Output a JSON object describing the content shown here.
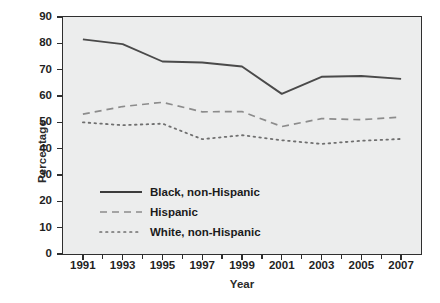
{
  "chart_data": {
    "type": "line",
    "title": "",
    "xlabel": "Year",
    "ylabel": "Percentage",
    "x": [
      1991,
      1993,
      1995,
      1997,
      1999,
      2001,
      2003,
      2005,
      2007
    ],
    "xlim": [
      1990,
      2008
    ],
    "ylim": [
      0,
      90
    ],
    "ytick_labels": [
      "0",
      "10",
      "20",
      "30",
      "40",
      "50",
      "60",
      "70",
      "80",
      "90"
    ],
    "ytick_values": [
      0,
      10,
      20,
      30,
      40,
      50,
      60,
      70,
      80,
      90
    ],
    "xtick_labels": [
      "1991",
      "1993",
      "1995",
      "1997",
      "1999",
      "2001",
      "2003",
      "2005",
      "2007"
    ],
    "xtick_values": [
      1991,
      1993,
      1995,
      1997,
      1999,
      2001,
      2003,
      2005,
      2007
    ],
    "grid": false,
    "legend_position": "lower-left-inside",
    "series": [
      {
        "name": "Black, non-Hispanic",
        "style": "solid",
        "color": "#4a4a4a",
        "values": [
          81.5,
          79.7,
          73.1,
          72.7,
          71.2,
          60.8,
          67.3,
          67.6,
          66.5
        ]
      },
      {
        "name": "Hispanic",
        "style": "dashed",
        "color": "#8c8c8c",
        "values": [
          53.1,
          56.0,
          57.6,
          54.0,
          54.1,
          48.4,
          51.4,
          51.0,
          52.0
        ]
      },
      {
        "name": "White, non-Hispanic",
        "style": "dotted",
        "color": "#6f6f6f",
        "values": [
          50.0,
          48.9,
          49.5,
          43.6,
          45.1,
          43.2,
          41.8,
          43.0,
          43.7
        ]
      }
    ]
  },
  "axes": {
    "y_title": "Percentage",
    "x_title": "Year"
  },
  "legend": {
    "items": [
      {
        "label": "Black, non-Hispanic"
      },
      {
        "label": "Hispanic"
      },
      {
        "label": "White, non-Hispanic"
      }
    ]
  },
  "colors": {
    "plot_background": "#eceded",
    "frame": "#2f2f2f",
    "text": "#1f1f1f",
    "solid_line": "#4a4a4a",
    "dashed_line": "#8c8c8c",
    "dotted_line": "#6f6f6f"
  }
}
